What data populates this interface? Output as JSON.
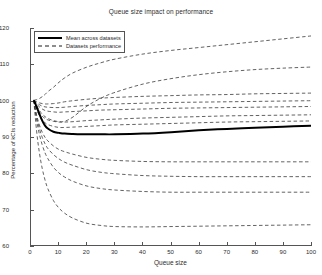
{
  "chart_data": {
    "type": "line",
    "title": "Queue size impact on performance",
    "xlabel": "Queue size",
    "ylabel": "Percentage of kCIs reduction",
    "xlim": [
      0,
      100
    ],
    "ylim": [
      60,
      120
    ],
    "xticks": [
      0,
      10,
      20,
      30,
      40,
      50,
      60,
      70,
      80,
      90,
      100
    ],
    "yticks": [
      60,
      70,
      80,
      90,
      100,
      110,
      120
    ],
    "grid": false,
    "legend_position": "upper-left",
    "legend": [
      {
        "label": "Mean across datasets",
        "style": "solid",
        "width": 2,
        "color": "#000000"
      },
      {
        "label": "Datasets performance",
        "style": "dashed",
        "width": 1,
        "color": "#000000"
      }
    ],
    "x": [
      1,
      2,
      3,
      4,
      5,
      6,
      8,
      10,
      12,
      15,
      20,
      25,
      30,
      40,
      50,
      60,
      70,
      80,
      90,
      100
    ],
    "series": [
      {
        "name": "Mean across datasets",
        "style": "solid",
        "values": [
          100,
          98.2,
          96.2,
          94.4,
          93.0,
          92.2,
          91.3,
          91.0,
          90.8,
          90.7,
          90.6,
          90.6,
          90.6,
          90.8,
          91.2,
          91.7,
          92.1,
          92.4,
          92.7,
          93.0
        ]
      },
      {
        "name": "Dataset 1",
        "style": "dashed",
        "values": [
          100,
          100.2,
          100.5,
          101.0,
          101.6,
          102.4,
          103.6,
          105.0,
          106.2,
          107.6,
          109.2,
          110.4,
          111.4,
          112.8,
          113.8,
          114.6,
          115.4,
          116.2,
          117.0,
          117.8
        ]
      },
      {
        "name": "Dataset 2",
        "style": "dashed",
        "values": [
          100,
          98.6,
          97.2,
          96.2,
          95.5,
          95.0,
          94.4,
          94.1,
          94.2,
          95.4,
          98.4,
          100.6,
          102.2,
          104.5,
          106.0,
          107.1,
          107.9,
          108.5,
          108.9,
          109.2
        ]
      },
      {
        "name": "Dataset 3",
        "style": "dashed",
        "values": [
          100,
          99.6,
          99.3,
          99.1,
          99.0,
          99.0,
          99.1,
          99.3,
          99.6,
          99.9,
          100.3,
          100.6,
          100.8,
          101.1,
          101.3,
          101.5,
          101.6,
          101.8,
          101.9,
          102.0
        ]
      },
      {
        "name": "Dataset 4",
        "style": "dashed",
        "values": [
          100,
          99.3,
          98.8,
          98.4,
          98.2,
          98.1,
          98.0,
          98.0,
          98.1,
          98.3,
          98.6,
          98.8,
          99.0,
          99.2,
          99.4,
          99.5,
          99.6,
          99.7,
          99.8,
          99.9
        ]
      },
      {
        "name": "Dataset 5",
        "style": "dashed",
        "values": [
          100,
          99.0,
          98.2,
          97.6,
          97.2,
          97.0,
          96.8,
          96.7,
          96.8,
          96.9,
          97.1,
          97.3,
          97.4,
          97.6,
          97.8,
          97.9,
          98.0,
          98.1,
          98.2,
          98.3
        ]
      },
      {
        "name": "Dataset 6",
        "style": "dashed",
        "values": [
          100,
          98.0,
          96.6,
          95.6,
          95.0,
          94.6,
          94.2,
          94.0,
          94.0,
          94.1,
          94.4,
          94.6,
          94.8,
          95.1,
          95.3,
          95.5,
          95.7,
          95.8,
          95.9,
          96.0
        ]
      },
      {
        "name": "Dataset 7",
        "style": "dashed",
        "values": [
          100,
          97.5,
          95.8,
          94.6,
          93.8,
          93.3,
          92.8,
          92.5,
          92.5,
          92.6,
          92.8,
          93.0,
          93.2,
          93.4,
          93.6,
          93.8,
          94.0,
          94.1,
          94.2,
          94.3
        ]
      },
      {
        "name": "Dataset 8",
        "style": "dashed",
        "values": [
          100,
          96.0,
          93.2,
          91.2,
          89.8,
          88.8,
          87.4,
          86.4,
          85.8,
          85.1,
          84.2,
          83.7,
          83.4,
          83.1,
          83.0,
          83.0,
          83.0,
          83.0,
          83.0,
          83.0
        ]
      },
      {
        "name": "Dataset 9",
        "style": "dashed",
        "values": [
          100,
          95.4,
          92.2,
          89.8,
          88.0,
          86.7,
          85.0,
          83.8,
          82.9,
          82.0,
          80.8,
          80.1,
          79.7,
          79.2,
          79.0,
          78.9,
          78.9,
          78.9,
          78.9,
          78.9
        ]
      },
      {
        "name": "Dataset 10",
        "style": "dashed",
        "values": [
          100,
          94.5,
          90.6,
          87.7,
          85.5,
          83.9,
          81.5,
          79.9,
          78.8,
          77.6,
          76.3,
          75.6,
          75.2,
          74.8,
          74.6,
          74.6,
          74.6,
          74.6,
          74.6,
          74.6
        ]
      },
      {
        "name": "Dataset 11",
        "style": "dashed",
        "values": [
          100,
          91.5,
          85.5,
          81.2,
          78.0,
          75.6,
          72.3,
          70.2,
          68.8,
          67.4,
          66.0,
          65.4,
          65.1,
          65.0,
          65.1,
          65.2,
          65.3,
          65.4,
          65.5,
          65.6
        ]
      }
    ]
  }
}
